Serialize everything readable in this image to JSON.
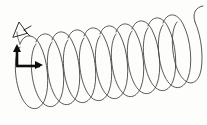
{
  "figure": {
    "kind": "line-drawing",
    "caption_text": "",
    "canvas": {
      "width": 207,
      "height": 125
    },
    "background_color": "#fdfdfc",
    "ink_color": "#3a3a3a",
    "annotation_color": "#0d0d0d"
  },
  "drawing_data": {
    "type": "helix",
    "turns": 11,
    "stroke_color": "#3a3a3a",
    "stroke_width": 0.85,
    "axis_start": {
      "x": 22,
      "y": 62
    },
    "axis_end": {
      "x": 192,
      "y": 52
    },
    "loop_radius_x": 12,
    "loop_radius_y": 46,
    "pitch": 16,
    "tail_end": {
      "x": 200,
      "y": 8
    },
    "loop_centers_x": [
      26,
      42,
      58,
      74,
      90,
      106,
      122,
      138,
      154,
      170,
      186
    ],
    "loop_top_y": [
      30,
      28,
      26,
      24,
      23,
      21,
      20,
      18,
      16,
      14,
      12
    ],
    "loop_bottom_y": [
      112,
      110,
      109,
      107,
      106,
      104,
      102,
      100,
      98,
      95,
      92
    ]
  },
  "annotations": {
    "bracket": {
      "name": "L-shaped measurement bracket",
      "color": "#0d0d0d",
      "vertical_segment": {
        "x": 17,
        "y1": 46,
        "y2": 67
      },
      "horizontal_segment": {
        "y": 66,
        "x1": 16,
        "x2": 40
      },
      "arrowheads": 2
    },
    "arrow_mark": {
      "name": "small triangular arrowhead",
      "color": "#0d0d0d",
      "position": {
        "x": 14,
        "y": 24
      },
      "size": 14
    }
  },
  "labels": []
}
